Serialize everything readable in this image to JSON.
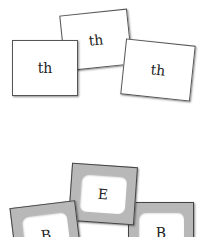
{
  "top_group": {
    "cards": [
      {
        "label": "th"
      },
      {
        "label": "th"
      },
      {
        "label": "th"
      }
    ]
  },
  "bottom_group": {
    "cards": [
      {
        "label": "B"
      },
      {
        "label": "E"
      },
      {
        "label": "B"
      }
    ]
  }
}
